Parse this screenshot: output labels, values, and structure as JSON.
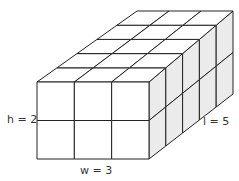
{
  "diagram": {
    "type": "rectangular-prism-unit-cubes",
    "width_units": 3,
    "height_units": 2,
    "length_units": 5,
    "labels": {
      "height": "h = 2",
      "width": "w = 3",
      "length": "l = 5"
    },
    "colors": {
      "stroke": "#222222",
      "front_face": "#ffffff",
      "top_face": "#ffffff",
      "side_face": "#ebebeb"
    }
  }
}
